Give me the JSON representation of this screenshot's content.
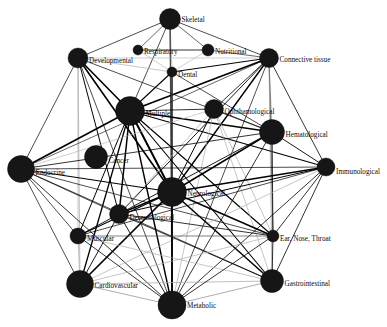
{
  "figure": {
    "type": "network-graph",
    "width": 387,
    "height": 327,
    "background_color": "#ffffff",
    "node_color": "#161616",
    "edge_color": "#000000",
    "edge_color_light": "#aeaeae"
  },
  "chart_data": {
    "type": "network",
    "xlabel": "",
    "ylabel": "",
    "grid": false,
    "legend": "none",
    "node_count": 20,
    "edge_count": 96,
    "nodes": [
      {
        "id": "skeletal",
        "label": "Skeletal",
        "x": 170,
        "y": 19,
        "r": 10.5,
        "label_dx": 13,
        "label_dy": 1
      },
      {
        "id": "respiratory",
        "label": "Respiratory",
        "x": 138,
        "y": 50,
        "r": 5.0,
        "label_dx": 7,
        "label_dy": 2
      },
      {
        "id": "nutritional",
        "label": "Nutritional",
        "x": 208,
        "y": 50,
        "r": 6.0,
        "label_dx": 9,
        "label_dy": 2
      },
      {
        "id": "developmental",
        "label": "Developmental",
        "x": 78,
        "y": 58,
        "r": 10.0,
        "label_dx": 12,
        "label_dy": 3
      },
      {
        "id": "connective-tissue",
        "label": "Connective tissue",
        "x": 269,
        "y": 58,
        "r": 9.5,
        "label_dx": 12,
        "label_dy": 2
      },
      {
        "id": "dental",
        "label": "Dental",
        "x": 172,
        "y": 72,
        "r": 5.0,
        "label_dx": 7,
        "label_dy": 3
      },
      {
        "id": "multiple",
        "label": "Multiple",
        "x": 130,
        "y": 111,
        "r": 14.5,
        "label_dx": 17,
        "label_dy": 3
      },
      {
        "id": "ophthalmological",
        "label": "Ophthamological",
        "x": 214,
        "y": 109,
        "r": 9.5,
        "label_dx": 12,
        "label_dy": 3
      },
      {
        "id": "hematological",
        "label": "Hematological",
        "x": 272,
        "y": 132,
        "r": 12.5,
        "label_dx": 15,
        "label_dy": 3
      },
      {
        "id": "cancer",
        "label": "Cancer",
        "x": 96,
        "y": 157,
        "r": 11.5,
        "label_dx": 14,
        "label_dy": 4
      },
      {
        "id": "endocrine",
        "label": "Endocrine",
        "x": 21,
        "y": 169,
        "r": 13.5,
        "label_dx": 16,
        "label_dy": 4
      },
      {
        "id": "immunological",
        "label": "Immunological",
        "x": 326,
        "y": 167,
        "r": 9.0,
        "label_dx": 12,
        "label_dy": 5
      },
      {
        "id": "neurological",
        "label": "Neurological",
        "x": 172,
        "y": 192,
        "r": 14.5,
        "label_dx": 17,
        "label_dy": 2
      },
      {
        "id": "dermatological",
        "label": "Dermatological",
        "x": 119,
        "y": 214,
        "r": 9.5,
        "label_dx": 12,
        "label_dy": 4
      },
      {
        "id": "muscular",
        "label": "Muscular",
        "x": 78,
        "y": 236,
        "r": 8.0,
        "label_dx": 10,
        "label_dy": 3
      },
      {
        "id": "ear-nose-throat",
        "label": "Ear, Nose, Throat",
        "x": 273,
        "y": 236,
        "r": 6.0,
        "label_dx": 9,
        "label_dy": 3
      },
      {
        "id": "cardiovascular",
        "label": "Cardiovascular",
        "x": 80,
        "y": 284,
        "r": 13.5,
        "label_dx": 16,
        "label_dy": 2
      },
      {
        "id": "gastrointestinal",
        "label": "Gastrointestinal",
        "x": 272,
        "y": 281,
        "r": 11.5,
        "label_dx": 14,
        "label_dy": 3
      },
      {
        "id": "metabolic",
        "label": "Metabolic",
        "x": 172,
        "y": 305,
        "r": 14.0,
        "label_dx": 17,
        "label_dy": 1
      }
    ],
    "edges": [
      {
        "source": "skeletal",
        "target": "developmental",
        "w": 0.7,
        "tone": "dark"
      },
      {
        "source": "skeletal",
        "target": "respiratory",
        "w": 0.6,
        "tone": "dark"
      },
      {
        "source": "skeletal",
        "target": "nutritional",
        "w": 0.6,
        "tone": "dark"
      },
      {
        "source": "skeletal",
        "target": "connective-tissue",
        "w": 0.7,
        "tone": "dark"
      },
      {
        "source": "skeletal",
        "target": "dental",
        "w": 0.8,
        "tone": "light"
      },
      {
        "source": "skeletal",
        "target": "multiple",
        "w": 0.7,
        "tone": "dark"
      },
      {
        "source": "skeletal",
        "target": "metabolic",
        "w": 1.1,
        "tone": "mid"
      },
      {
        "source": "skeletal",
        "target": "neurological",
        "w": 0.9,
        "tone": "mid"
      },
      {
        "source": "respiratory",
        "target": "nutritional",
        "w": 0.8,
        "tone": "dark"
      },
      {
        "source": "respiratory",
        "target": "dental",
        "w": 0.6,
        "tone": "light"
      },
      {
        "source": "nutritional",
        "target": "connective-tissue",
        "w": 0.6,
        "tone": "dark"
      },
      {
        "source": "nutritional",
        "target": "dental",
        "w": 0.6,
        "tone": "light"
      },
      {
        "source": "developmental",
        "target": "dental",
        "w": 0.7,
        "tone": "light"
      },
      {
        "source": "developmental",
        "target": "multiple",
        "w": 1.6,
        "tone": "dark"
      },
      {
        "source": "developmental",
        "target": "endocrine",
        "w": 0.7,
        "tone": "dark"
      },
      {
        "source": "developmental",
        "target": "neurological",
        "w": 1.6,
        "tone": "dark"
      },
      {
        "source": "developmental",
        "target": "cardiovascular",
        "w": 0.8,
        "tone": "light"
      },
      {
        "source": "developmental",
        "target": "muscular",
        "w": 0.7,
        "tone": "light"
      },
      {
        "source": "developmental",
        "target": "dermatological",
        "w": 1.0,
        "tone": "dark"
      },
      {
        "source": "developmental",
        "target": "metabolic",
        "w": 0.7,
        "tone": "dark"
      },
      {
        "source": "developmental",
        "target": "hematological",
        "w": 0.7,
        "tone": "dark"
      },
      {
        "source": "developmental",
        "target": "connective-tissue",
        "w": 0.6,
        "tone": "light"
      },
      {
        "source": "connective-tissue",
        "target": "multiple",
        "w": 1.7,
        "tone": "dark"
      },
      {
        "source": "connective-tissue",
        "target": "dental",
        "w": 1.0,
        "tone": "dark"
      },
      {
        "source": "connective-tissue",
        "target": "ophthalmological",
        "w": 0.8,
        "tone": "dark"
      },
      {
        "source": "connective-tissue",
        "target": "hematological",
        "w": 1.0,
        "tone": "light"
      },
      {
        "source": "connective-tissue",
        "target": "neurological",
        "w": 1.4,
        "tone": "dark"
      },
      {
        "source": "connective-tissue",
        "target": "immunological",
        "w": 0.8,
        "tone": "dark"
      },
      {
        "source": "connective-tissue",
        "target": "dermatological",
        "w": 0.9,
        "tone": "dark"
      },
      {
        "source": "connective-tissue",
        "target": "ear-nose-throat",
        "w": 0.7,
        "tone": "dark"
      },
      {
        "source": "connective-tissue",
        "target": "gastrointestinal",
        "w": 0.7,
        "tone": "light"
      },
      {
        "source": "connective-tissue",
        "target": "metabolic",
        "w": 0.7,
        "tone": "dark"
      },
      {
        "source": "connective-tissue",
        "target": "endocrine",
        "w": 0.6,
        "tone": "dark"
      },
      {
        "source": "dental",
        "target": "multiple",
        "w": 1.1,
        "tone": "dark"
      },
      {
        "source": "dental",
        "target": "neurological",
        "w": 1.3,
        "tone": "dark"
      },
      {
        "source": "dental",
        "target": "metabolic",
        "w": 1.0,
        "tone": "mid"
      },
      {
        "source": "dental",
        "target": "hematological",
        "w": 0.7,
        "tone": "dark"
      },
      {
        "source": "multiple",
        "target": "ophthalmological",
        "w": 0.8,
        "tone": "dark"
      },
      {
        "source": "multiple",
        "target": "hematological",
        "w": 1.4,
        "tone": "dark"
      },
      {
        "source": "multiple",
        "target": "endocrine",
        "w": 1.6,
        "tone": "dark"
      },
      {
        "source": "multiple",
        "target": "immunological",
        "w": 1.2,
        "tone": "dark"
      },
      {
        "source": "multiple",
        "target": "neurological",
        "w": 2.0,
        "tone": "dark"
      },
      {
        "source": "multiple",
        "target": "dermatological",
        "w": 1.5,
        "tone": "dark"
      },
      {
        "source": "multiple",
        "target": "muscular",
        "w": 1.0,
        "tone": "dark"
      },
      {
        "source": "multiple",
        "target": "cardiovascular",
        "w": 1.3,
        "tone": "dark"
      },
      {
        "source": "multiple",
        "target": "metabolic",
        "w": 1.4,
        "tone": "dark"
      },
      {
        "source": "multiple",
        "target": "gastrointestinal",
        "w": 1.1,
        "tone": "dark"
      },
      {
        "source": "multiple",
        "target": "ear-nose-throat",
        "w": 1.1,
        "tone": "dark"
      },
      {
        "source": "ophthalmological",
        "target": "neurological",
        "w": 1.0,
        "tone": "dark"
      },
      {
        "source": "ophthalmological",
        "target": "hematological",
        "w": 0.7,
        "tone": "dark"
      },
      {
        "source": "ophthalmological",
        "target": "endocrine",
        "w": 0.6,
        "tone": "light"
      },
      {
        "source": "ophthalmological",
        "target": "dermatological",
        "w": 0.7,
        "tone": "light"
      },
      {
        "source": "ophthalmological",
        "target": "gastrointestinal",
        "w": 0.7,
        "tone": "light"
      },
      {
        "source": "ophthalmological",
        "target": "ear-nose-throat",
        "w": 0.7,
        "tone": "light"
      },
      {
        "source": "ophthalmological",
        "target": "metabolic",
        "w": 0.7,
        "tone": "light"
      },
      {
        "source": "hematological",
        "target": "immunological",
        "w": 0.9,
        "tone": "dark"
      },
      {
        "source": "hematological",
        "target": "neurological",
        "w": 1.5,
        "tone": "dark"
      },
      {
        "source": "hematological",
        "target": "endocrine",
        "w": 0.8,
        "tone": "dark"
      },
      {
        "source": "hematological",
        "target": "gastrointestinal",
        "w": 0.9,
        "tone": "light"
      },
      {
        "source": "hematological",
        "target": "ear-nose-throat",
        "w": 0.8,
        "tone": "dark"
      },
      {
        "source": "hematological",
        "target": "dermatological",
        "w": 0.9,
        "tone": "dark"
      },
      {
        "source": "hematological",
        "target": "metabolic",
        "w": 0.8,
        "tone": "dark"
      },
      {
        "source": "endocrine",
        "target": "neurological",
        "w": 1.1,
        "tone": "dark"
      },
      {
        "source": "endocrine",
        "target": "muscular",
        "w": 0.7,
        "tone": "dark"
      },
      {
        "source": "endocrine",
        "target": "cardiovascular",
        "w": 0.7,
        "tone": "dark"
      },
      {
        "source": "endocrine",
        "target": "dermatological",
        "w": 0.7,
        "tone": "dark"
      },
      {
        "source": "endocrine",
        "target": "metabolic",
        "w": 0.8,
        "tone": "dark"
      },
      {
        "source": "endocrine",
        "target": "immunological",
        "w": 0.7,
        "tone": "dark"
      },
      {
        "source": "endocrine",
        "target": "gastrointestinal",
        "w": 0.7,
        "tone": "dark"
      },
      {
        "source": "endocrine",
        "target": "ear-nose-throat",
        "w": 0.7,
        "tone": "dark"
      },
      {
        "source": "immunological",
        "target": "neurological",
        "w": 1.3,
        "tone": "dark"
      },
      {
        "source": "immunological",
        "target": "dermatological",
        "w": 1.0,
        "tone": "dark"
      },
      {
        "source": "immunological",
        "target": "gastrointestinal",
        "w": 0.8,
        "tone": "dark"
      },
      {
        "source": "immunological",
        "target": "ear-nose-throat",
        "w": 0.8,
        "tone": "dark"
      },
      {
        "source": "immunological",
        "target": "metabolic",
        "w": 0.8,
        "tone": "dark"
      },
      {
        "source": "immunological",
        "target": "muscular",
        "w": 0.7,
        "tone": "dark"
      },
      {
        "source": "immunological",
        "target": "cardiovascular",
        "w": 0.7,
        "tone": "light"
      },
      {
        "source": "neurological",
        "target": "dermatological",
        "w": 1.6,
        "tone": "dark"
      },
      {
        "source": "neurological",
        "target": "muscular",
        "w": 1.2,
        "tone": "dark"
      },
      {
        "source": "neurological",
        "target": "cardiovascular",
        "w": 1.7,
        "tone": "dark"
      },
      {
        "source": "neurological",
        "target": "metabolic",
        "w": 1.8,
        "tone": "dark"
      },
      {
        "source": "neurological",
        "target": "gastrointestinal",
        "w": 1.5,
        "tone": "dark"
      },
      {
        "source": "neurological",
        "target": "ear-nose-throat",
        "w": 1.4,
        "tone": "dark"
      },
      {
        "source": "dermatological",
        "target": "muscular",
        "w": 0.9,
        "tone": "dark"
      },
      {
        "source": "dermatological",
        "target": "cardiovascular",
        "w": 0.9,
        "tone": "dark"
      },
      {
        "source": "dermatological",
        "target": "metabolic",
        "w": 0.9,
        "tone": "dark"
      },
      {
        "source": "dermatological",
        "target": "gastrointestinal",
        "w": 0.8,
        "tone": "dark"
      },
      {
        "source": "dermatological",
        "target": "ear-nose-throat",
        "w": 0.8,
        "tone": "dark"
      },
      {
        "source": "muscular",
        "target": "cardiovascular",
        "w": 0.8,
        "tone": "light"
      },
      {
        "source": "muscular",
        "target": "metabolic",
        "w": 0.8,
        "tone": "dark"
      },
      {
        "source": "muscular",
        "target": "ear-nose-throat",
        "w": 0.7,
        "tone": "mid"
      },
      {
        "source": "muscular",
        "target": "gastrointestinal",
        "w": 0.7,
        "tone": "light"
      },
      {
        "source": "cardiovascular",
        "target": "metabolic",
        "w": 1.0,
        "tone": "light"
      },
      {
        "source": "cardiovascular",
        "target": "gastrointestinal",
        "w": 0.8,
        "tone": "light"
      },
      {
        "source": "cardiovascular",
        "target": "ear-nose-throat",
        "w": 0.7,
        "tone": "light"
      },
      {
        "source": "ear-nose-throat",
        "target": "gastrointestinal",
        "w": 0.8,
        "tone": "dark"
      },
      {
        "source": "ear-nose-throat",
        "target": "metabolic",
        "w": 0.8,
        "tone": "dark"
      },
      {
        "source": "gastrointestinal",
        "target": "metabolic",
        "w": 1.0,
        "tone": "light"
      }
    ],
    "isolated_nodes": [
      "cancer"
    ]
  }
}
